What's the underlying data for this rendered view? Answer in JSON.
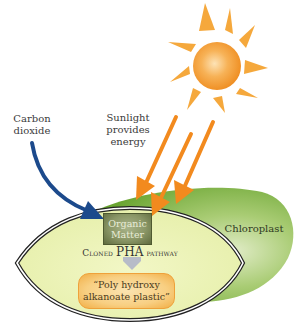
{
  "diagram": {
    "labels": {
      "carbon_dioxide": [
        "Carbon",
        "dioxide"
      ],
      "sunlight": [
        "Sunlight",
        "provides",
        "energy"
      ],
      "chloroplast": "Chloroplast",
      "organic_matter": [
        "Organic",
        "Matter"
      ],
      "pathway": {
        "prefix": "Cloned ",
        "emphasis": "PHA",
        "suffix": " pathway"
      },
      "plastic": [
        "“Poly hydroxy",
        "alkanoate plastic”"
      ]
    },
    "icons": {
      "sun": "sun-icon",
      "co2_arrow": "curved-arrow-icon",
      "sunlight_arrows": "arrow-icon",
      "pathway_arrow": "down-arrow-icon"
    },
    "colors": {
      "sun": "#f39a2b",
      "sun_rays": "#f5a83c",
      "sunlight_arrows": "#f28a1e",
      "co2_arrow": "#1c4a8c",
      "chloroplast": "#7fb044",
      "chloroplast_light": "#cfe3a8",
      "cell_fill": "#eef4b8",
      "organic_box": "#7d8a58",
      "plastic_fill": "#f8cf82",
      "plastic_border": "#efa13a",
      "pathway_arrow": "#b7bcc8"
    }
  }
}
